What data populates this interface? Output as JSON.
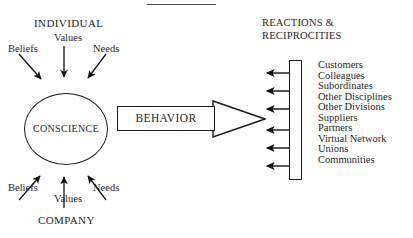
{
  "diagram": {
    "title_rule": "",
    "headings": {
      "individual": "INDIVIDUAL",
      "company": "COMPANY",
      "reactions": "REACTIONS &\nRECIPROCITIES",
      "reactions_line1": "REACTIONS &",
      "reactions_line2": "RECIPROCITIES"
    },
    "core": {
      "label": "CONSCIENCE"
    },
    "flow": {
      "label": "BEHAVIOR"
    },
    "individual_inputs": [
      {
        "label": "Beliefs"
      },
      {
        "label": "Values"
      },
      {
        "label": "Needs"
      }
    ],
    "company_inputs": [
      {
        "label": "Beliefs"
      },
      {
        "label": "Values"
      },
      {
        "label": "Needs"
      }
    ],
    "stakeholders": [
      {
        "label": "Customers"
      },
      {
        "label": "Colleagues"
      },
      {
        "label": "Subordinates"
      },
      {
        "label": "Other Disciplines"
      },
      {
        "label": "Other Divisions"
      },
      {
        "label": "Suppliers"
      },
      {
        "label": "Partners"
      },
      {
        "label": "Virtual Network"
      },
      {
        "label": "Unions"
      },
      {
        "label": "Communities"
      }
    ],
    "reaction_arrow_count": 6,
    "colors": {
      "background": "#ffffff",
      "stroke": "#1a1a1a",
      "text": "#262626",
      "rule": "#4c4c4c"
    }
  }
}
